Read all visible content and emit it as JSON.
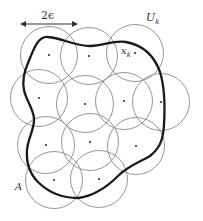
{
  "figure": {
    "type": "covering-of-set-by-balls",
    "labels": {
      "diameter": "2ϵ",
      "ball": "U",
      "ball_sub": "k",
      "center": "x",
      "center_sub": "k",
      "set": "A"
    },
    "radius": 28.5,
    "circles": [
      {
        "cx": 49,
        "cy": 55
      },
      {
        "cx": 89,
        "cy": 56
      },
      {
        "cx": 135,
        "cy": 53
      },
      {
        "cx": 39,
        "cy": 98
      },
      {
        "cx": 85,
        "cy": 104
      },
      {
        "cx": 124,
        "cy": 101
      },
      {
        "cx": 161,
        "cy": 102
      },
      {
        "cx": 46,
        "cy": 145
      },
      {
        "cx": 90,
        "cy": 142
      },
      {
        "cx": 136,
        "cy": 146
      },
      {
        "cx": 54,
        "cy": 180
      },
      {
        "cx": 99,
        "cy": 179
      }
    ],
    "colors": {
      "circle": "#8a8a8a",
      "curve": "#1a1a1a",
      "dot": "#222222",
      "arrow": "#333333"
    }
  }
}
